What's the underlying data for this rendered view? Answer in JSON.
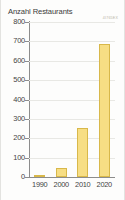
{
  "chart_data": {
    "type": "bar",
    "title": "Anzahl Restaurants",
    "xlabel": "",
    "ylabel": "",
    "categories": [
      "1990",
      "2000",
      "2010",
      "2020"
    ],
    "values": [
      5,
      47,
      252,
      687
    ],
    "ylim": [
      0,
      800
    ],
    "yticks": [
      "0",
      "100",
      "200",
      "300",
      "400",
      "500",
      "600",
      "700",
      "800"
    ],
    "ytick_values": [
      0,
      100,
      200,
      300,
      400,
      500,
      600,
      700,
      800
    ],
    "grid": true,
    "legend": null,
    "series": [
      {
        "name": "Anzahl Restaurants",
        "values": [
          5,
          47,
          252,
          687
        ]
      }
    ],
    "bar_color": "#f7de84",
    "bar_border_color": "#d8b84a",
    "axis_color": "#8c8c8c",
    "grid_color": "#e8e8e4",
    "background_color": "#fdfdfc",
    "watermark": "4I765EX"
  }
}
